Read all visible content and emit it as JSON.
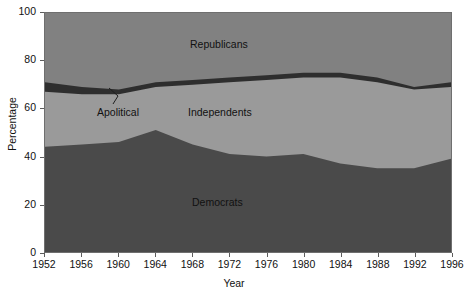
{
  "chart_data": {
    "type": "area",
    "title": "",
    "xlabel": "Year",
    "ylabel": "Percentage",
    "stacked": true,
    "grid": false,
    "legend_position": "inline-labels",
    "xlim": [
      1952,
      1996
    ],
    "ylim": [
      0,
      100
    ],
    "x": [
      1952,
      1956,
      1960,
      1964,
      1968,
      1972,
      1976,
      1980,
      1984,
      1988,
      1992,
      1996
    ],
    "xticks": [
      "1952",
      "1956",
      "1960",
      "1964",
      "1968",
      "1972",
      "1976",
      "1980",
      "1984",
      "1988",
      "1992",
      "1996"
    ],
    "yticks": [
      "0",
      "20",
      "40",
      "60",
      "80",
      "100"
    ],
    "series": [
      {
        "name": "Democrats",
        "color": "#4a4a4a",
        "values": [
          44,
          45,
          46,
          51,
          45,
          41,
          40,
          41,
          37,
          35,
          35,
          39
        ]
      },
      {
        "name": "Independents",
        "color": "#9a9a9a",
        "values": [
          23,
          21,
          20,
          18,
          25,
          30,
          32,
          32,
          36,
          36,
          33,
          30
        ]
      },
      {
        "name": "Apolitical",
        "color": "#2e2e2e",
        "values": [
          4,
          3,
          2,
          2,
          2,
          2,
          2,
          2,
          2,
          2,
          1,
          2
        ]
      },
      {
        "name": "Republicans",
        "color": "#818181",
        "values": [
          29,
          31,
          32,
          29,
          28,
          27,
          26,
          25,
          25,
          27,
          31,
          29
        ]
      }
    ],
    "cumulative_boundaries": {
      "democrats_top": [
        44,
        45,
        46,
        51,
        45,
        41,
        40,
        41,
        37,
        35,
        35,
        39
      ],
      "independents_top": [
        67,
        66,
        66,
        69,
        70,
        71,
        72,
        73,
        73,
        71,
        68,
        69
      ],
      "apolitical_top": [
        71,
        69,
        68,
        71,
        72,
        73,
        74,
        75,
        75,
        73,
        69,
        71
      ]
    },
    "annotations": [
      {
        "text": "Apolitical",
        "target_series": "Apolitical",
        "leader_line": true
      }
    ]
  },
  "labels": {
    "republicans": "Republicans",
    "independents": "Independents",
    "apolitical": "Apolitical",
    "democrats": "Democrats"
  },
  "axes": {
    "x_title": "Year",
    "y_title": "Percentage"
  }
}
